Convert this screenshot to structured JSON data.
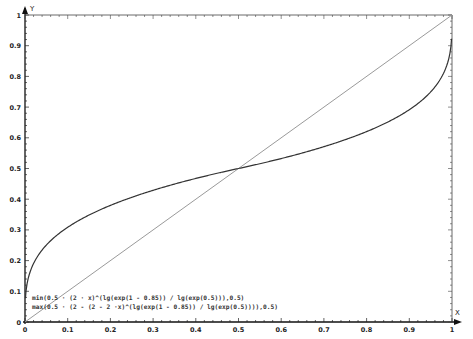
{
  "chart_data": {
    "type": "line",
    "title": "",
    "xlabel": "X",
    "ylabel": "Y",
    "xlim": [
      0,
      1
    ],
    "ylim": [
      0,
      1
    ],
    "grid": false,
    "x_ticks": [
      "0",
      "0.1",
      "0.2",
      "0.3",
      "0.4",
      "0.5",
      "0.6",
      "0.7",
      "0.8",
      "0.9",
      "1"
    ],
    "y_ticks": [
      "0",
      "0.1",
      "0.2",
      "0.3",
      "0.4",
      "0.5",
      "0.6",
      "0.7",
      "0.8",
      "0.9",
      "1"
    ],
    "legend_position": "bottom-left",
    "series": [
      {
        "name": "min(0.5 · (2 · x)^(lg(exp(1 - 0.85)) / lg(exp(0.5))),0.5)",
        "color": "#333333",
        "x": [
          0.001,
          0.05,
          0.1,
          0.15,
          0.2,
          0.25,
          0.3,
          0.35,
          0.4,
          0.45,
          0.5
        ],
        "values": [
          0.078,
          0.25,
          0.308,
          0.347,
          0.38,
          0.406,
          0.429,
          0.45,
          0.467,
          0.484,
          0.5
        ]
      },
      {
        "name": "max(0.5 · (2 - (2 - 2 ·x)^(lg(exp(1 - 0.85)) / lg(exp(0.5)))),0.5)",
        "color": "#333333",
        "x": [
          0.5,
          0.55,
          0.6,
          0.65,
          0.7,
          0.75,
          0.8,
          0.85,
          0.9,
          0.95,
          0.999
        ],
        "values": [
          0.5,
          0.516,
          0.533,
          0.55,
          0.571,
          0.594,
          0.62,
          0.653,
          0.692,
          0.75,
          0.922
        ]
      },
      {
        "name": "y = x",
        "color": "#999999",
        "x": [
          0,
          1
        ],
        "values": [
          0,
          1
        ]
      }
    ],
    "exponent": 0.3
  },
  "axes": {
    "x_name": "X",
    "y_name": "Y"
  },
  "legend": {
    "line1": "min(0.5 · (2 · x)^(lg(exp(1 - 0.85)) / lg(exp(0.5))),0.5)",
    "line2": "max(0.5 · (2 - (2 - 2 ·x)^(lg(exp(1 - 0.85)) / lg(exp(0.5)))),0.5)"
  }
}
